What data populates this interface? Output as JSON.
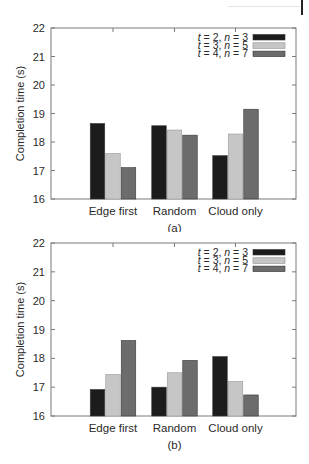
{
  "chart_data": [
    {
      "id": "a",
      "type": "bar",
      "caption": "(a)",
      "title": "",
      "xlabel": "",
      "ylabel": "Completion time (s)",
      "ylim": [
        16,
        22
      ],
      "yticks": [
        16,
        17,
        18,
        19,
        20,
        21,
        22
      ],
      "grid": false,
      "legend_position": "upper right",
      "categories": [
        "Edge first",
        "Random",
        "Cloud only"
      ],
      "series": [
        {
          "name": "t = 2, n = 3",
          "t": "2",
          "n": "3",
          "color": "#1c1c1c",
          "values": [
            18.65,
            18.57,
            17.52
          ]
        },
        {
          "name": "t = 3, n = 5",
          "t": "3",
          "n": "5",
          "color": "#c6c6c6",
          "values": [
            17.6,
            18.42,
            18.28
          ]
        },
        {
          "name": "t = 4, n = 7",
          "t": "4",
          "n": "7",
          "color": "#6c6c6c",
          "values": [
            17.1,
            18.24,
            19.15
          ]
        }
      ]
    },
    {
      "id": "b",
      "type": "bar",
      "caption": "(b)",
      "title": "",
      "xlabel": "",
      "ylabel": "Completion time (s)",
      "ylim": [
        16,
        22
      ],
      "yticks": [
        16,
        17,
        18,
        19,
        20,
        21,
        22
      ],
      "grid": false,
      "legend_position": "upper right",
      "categories": [
        "Edge first",
        "Random",
        "Cloud only"
      ],
      "series": [
        {
          "name": "t = 2, n = 3",
          "t": "2",
          "n": "3",
          "color": "#1c1c1c",
          "values": [
            16.92,
            17.0,
            18.06
          ]
        },
        {
          "name": "t = 3, n = 5",
          "t": "3",
          "n": "5",
          "color": "#c6c6c6",
          "values": [
            17.44,
            17.5,
            17.2
          ]
        },
        {
          "name": "t = 4, n = 7",
          "t": "4",
          "n": "7",
          "color": "#6c6c6c",
          "values": [
            18.62,
            17.93,
            16.73
          ]
        }
      ]
    }
  ]
}
